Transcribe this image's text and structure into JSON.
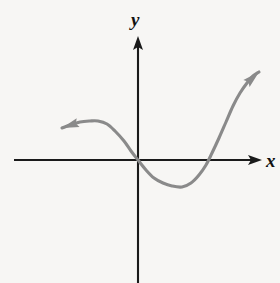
{
  "figure": {
    "background_color": "#f7f6f4",
    "axis_color": "#1a1a1a",
    "curve_color": "#8a8a8a"
  },
  "labels": {
    "x_axis": "x",
    "y_axis": "y"
  },
  "chart_data": {
    "type": "line",
    "title": "",
    "xlabel": "x",
    "ylabel": "y",
    "grid": false,
    "legend": null,
    "axis_style": "arrows-both-ends",
    "origin_px": [
      138,
      160
    ],
    "xlim_px": [
      14,
      262
    ],
    "ylim_px": [
      36,
      283
    ],
    "annotations": [
      "curve has left-pointing arrowhead at its left end",
      "curve has up-right-pointing arrowhead at its right end",
      "curve passes through the origin",
      "local maximum left of the y-axis, above the x-axis",
      "local minimum right of the y-axis, below the x-axis"
    ],
    "series": [
      {
        "name": "f(x)",
        "points_px": [
          [
            62,
            128
          ],
          [
            70,
            125
          ],
          [
            80,
            122
          ],
          [
            90,
            121
          ],
          [
            98,
            121
          ],
          [
            107,
            124
          ],
          [
            115,
            131
          ],
          [
            124,
            141
          ],
          [
            131,
            151
          ],
          [
            138,
            160
          ],
          [
            146,
            170
          ],
          [
            154,
            178
          ],
          [
            163,
            183
          ],
          [
            172,
            186
          ],
          [
            182,
            187
          ],
          [
            191,
            183
          ],
          [
            199,
            175
          ],
          [
            206,
            165
          ],
          [
            212,
            153
          ],
          [
            219,
            138
          ],
          [
            226,
            122
          ],
          [
            233,
            106
          ],
          [
            240,
            93
          ],
          [
            247,
            83
          ],
          [
            253,
            76
          ],
          [
            259,
            72
          ]
        ],
        "key_points": {
          "left_arrow_tip_px": [
            62,
            128
          ],
          "local_max_px": [
            98,
            121
          ],
          "origin_crossing_px": [
            138,
            160
          ],
          "local_min_px": [
            182,
            187
          ],
          "right_x_crossing_px": [
            210,
            160
          ],
          "right_arrow_tip_px": [
            259,
            72
          ]
        }
      }
    ]
  }
}
